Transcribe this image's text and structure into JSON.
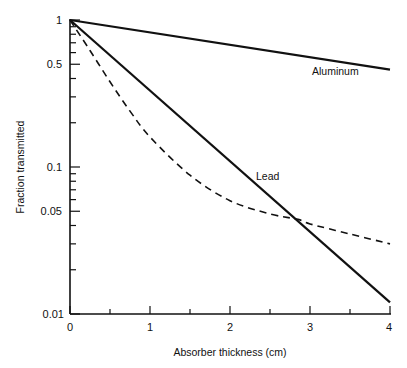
{
  "chart_data": {
    "type": "line",
    "title": "",
    "xlabel": "Absorber thickness (cm)",
    "ylabel": "Fraction transmitted",
    "yscale": "log",
    "xlim": [
      0,
      4
    ],
    "ylim": [
      0.01,
      1
    ],
    "grid": false,
    "legend": "none (inline labels)",
    "x_ticks": [
      0,
      1,
      2,
      3,
      4
    ],
    "x_tick_labels": [
      "0",
      "1",
      "2",
      "3",
      "4"
    ],
    "x_minor_ticks": [
      0.5,
      1.5,
      2.5,
      3.5
    ],
    "y_ticks": [
      1,
      0.5,
      0.1,
      0.05,
      0.01
    ],
    "y_tick_labels": [
      "1",
      "0.5",
      "0.1",
      "0.05",
      "0.01"
    ],
    "y_minor_ticks": [
      0.9,
      0.8,
      0.7,
      0.6,
      0.4,
      0.3,
      0.2,
      0.09,
      0.08,
      0.07,
      0.06,
      0.04,
      0.03,
      0.02
    ],
    "series": [
      {
        "name": "Aluminum",
        "style": "solid",
        "label": "Aluminum",
        "x": [
          0,
          4
        ],
        "y": [
          1,
          0.46
        ]
      },
      {
        "name": "Lead",
        "style": "solid",
        "label": "Lead",
        "x": [
          0,
          1,
          2,
          2.85,
          3,
          4
        ],
        "y": [
          1,
          0.34,
          0.115,
          0.044,
          0.039,
          0.012
        ]
      },
      {
        "name": "Unlabeled (dashed)",
        "style": "dashed",
        "label": "",
        "x": [
          0,
          0.25,
          0.5,
          0.75,
          1,
          1.5,
          2,
          2.5,
          2.85,
          3,
          3.5,
          4
        ],
        "y": [
          1,
          0.62,
          0.38,
          0.24,
          0.16,
          0.088,
          0.059,
          0.048,
          0.044,
          0.041,
          0.035,
          0.03
        ]
      }
    ]
  },
  "labels": {
    "ylabel": "Fraction transmitted",
    "xlabel": "Absorber thickness (cm)",
    "aluminum": "Aluminum",
    "lead": "Lead",
    "y_ticks": [
      "1",
      "0.5",
      "0.1",
      "0.05",
      "0.01"
    ],
    "x_ticks": [
      "0",
      "1",
      "2",
      "3",
      "4"
    ]
  }
}
